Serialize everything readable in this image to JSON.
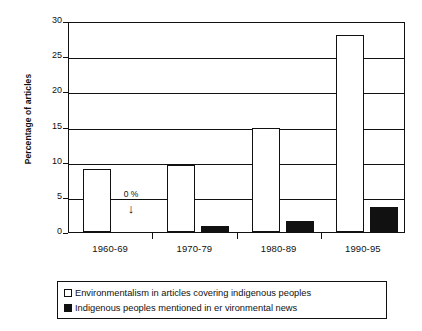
{
  "chart_data": {
    "type": "bar",
    "title": "",
    "xlabel": "",
    "ylabel": "Percentage of articles",
    "ylim": [
      0,
      30
    ],
    "yticks": [
      0,
      5,
      10,
      15,
      20,
      25,
      30
    ],
    "ytick_labels": [
      "0",
      "5",
      "10",
      "15",
      "20",
      "25",
      "30"
    ],
    "grid": true,
    "legend_position": "below",
    "categories": [
      "1960-69",
      "1970-79",
      "1980-89",
      "1990-95"
    ],
    "series": [
      {
        "name": "Environmentalism in articles covering indigenous peoples",
        "style": "open",
        "values": [
          9.0,
          9.5,
          14.8,
          28.0
        ]
      },
      {
        "name": "Indigenous peoples mentioned in er vironmental news",
        "style": "filled",
        "values": [
          0,
          0.8,
          1.5,
          3.6
        ]
      }
    ],
    "annotations": [
      {
        "label": "0 %",
        "arrow": "↓",
        "category": "1960-69",
        "series": "Indigenous peoples mentioned in er vironmental news"
      }
    ]
  },
  "legend": {
    "items": [
      {
        "swatch": "open-square-swatch",
        "label": "Environmentalism in articles covering indigenous peoples"
      },
      {
        "swatch": "filled-square-swatch",
        "label": "Indigenous peoples mentioned in er vironmental news"
      }
    ]
  }
}
